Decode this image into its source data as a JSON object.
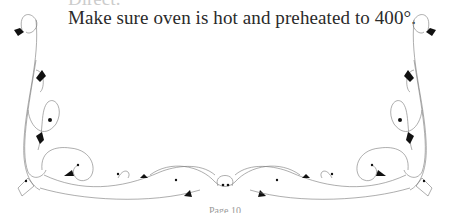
{
  "document": {
    "cut_off_heading": "Direct:",
    "instruction_text": "Make sure oven is hot and preheated to 400°.",
    "footer_text": "Page 10"
  },
  "decoration": {
    "type": "floral-flourish-border",
    "line_color": "#777777",
    "leaf_color": "#111111"
  }
}
